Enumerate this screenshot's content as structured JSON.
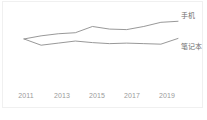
{
  "chart_data": {
    "type": "line",
    "title": "",
    "subtitle": "",
    "xlabel": "",
    "ylabel": "",
    "grid": false,
    "legend_position": "right-inline",
    "x": [
      2011,
      2012,
      2013,
      2014,
      2015,
      2016,
      2017,
      2018,
      2019,
      2020
    ],
    "tick_labels": [
      "2011",
      "2013",
      "2015",
      "2017",
      "2019"
    ],
    "tick_values": [
      2011,
      2013,
      2015,
      2017,
      2019
    ],
    "xlim": [
      2011,
      2020
    ],
    "ylim": [
      0,
      100
    ],
    "series": [
      {
        "name": "手机",
        "color": "#8c8c8c",
        "values": [
          52,
          58,
          62,
          64,
          76,
          71,
          70,
          76,
          84,
          86
        ],
        "label_position": "end"
      },
      {
        "name": "笔记本",
        "color": "#8c8c8c",
        "values": [
          52,
          40,
          44,
          48,
          45,
          43,
          44,
          43,
          42,
          53
        ],
        "label_position": "end"
      }
    ]
  },
  "legend": {
    "mobile_label": "手机",
    "laptop_label": "笔记本"
  },
  "axis": {
    "x_labels": [
      "2011",
      "2013",
      "2015",
      "2017",
      "2019"
    ]
  },
  "colors": {
    "line": "#8c8c8c",
    "tick_text": "#9a9a9a",
    "legend_text": "#6e6e6e",
    "background": "#ffffff",
    "border": "#f0f0f0"
  }
}
